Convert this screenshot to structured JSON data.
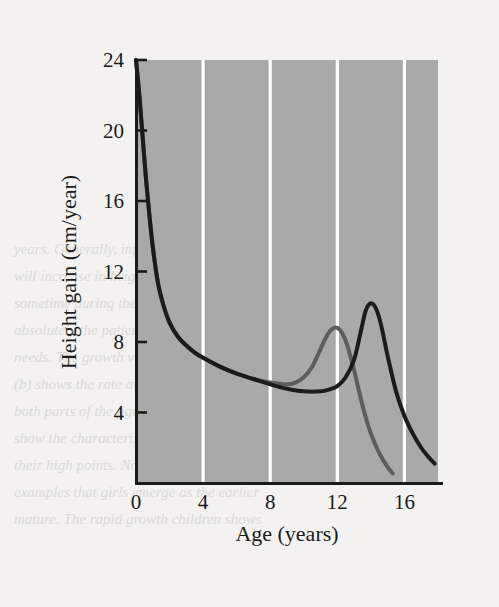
{
  "figure": {
    "plot_background_color": "#a9a9a7",
    "page_background_color": "#f3f2f0",
    "gridline_color": "#ffffff",
    "axis_color": "#1b1b1b"
  },
  "chart_data": {
    "type": "line",
    "title": "",
    "subtitle": "",
    "xlabel": "Age (years)",
    "ylabel": "Height gain (cm/year)",
    "xlim": [
      0,
      18
    ],
    "ylim": [
      0,
      24
    ],
    "xticks": [
      0,
      4,
      8,
      12,
      16
    ],
    "xtick_labels": [
      "0",
      "4",
      "8",
      "12",
      "16"
    ],
    "yticks": [
      4,
      8,
      12,
      16,
      20,
      24
    ],
    "ytick_labels": [
      "4",
      "8",
      "12",
      "16",
      "20",
      "24"
    ],
    "grid": "vertical-only",
    "grid_color": "#ffffff",
    "legend": "none",
    "legend_position": "none",
    "annotations": [],
    "series": [
      {
        "name": "girls",
        "color": "#5d5d5d",
        "line_width": 4,
        "peak_age": 12.0,
        "peak_value": 8.8,
        "x": [
          0,
          0.2,
          0.4,
          0.6,
          0.8,
          1.0,
          1.3,
          1.6,
          2.0,
          2.5,
          3.0,
          3.5,
          4.0,
          5.0,
          6.0,
          7.0,
          8.0,
          9.0,
          9.5,
          10.0,
          10.5,
          11.0,
          11.4,
          11.7,
          12.0,
          12.3,
          12.6,
          13.0,
          13.5,
          14.0,
          14.5,
          15.0,
          15.3
        ],
        "y": [
          24.0,
          22.0,
          19.6,
          17.2,
          15.2,
          13.4,
          11.4,
          10.2,
          9.1,
          8.3,
          7.8,
          7.4,
          7.1,
          6.6,
          6.2,
          5.9,
          5.7,
          5.6,
          5.7,
          6.0,
          6.6,
          7.6,
          8.4,
          8.75,
          8.8,
          8.5,
          7.8,
          6.4,
          4.4,
          2.8,
          1.7,
          0.9,
          0.55
        ]
      },
      {
        "name": "boys",
        "color": "#1b1b1b",
        "line_width": 4,
        "peak_age": 14.0,
        "peak_value": 10.2,
        "x": [
          0,
          0.2,
          0.4,
          0.6,
          0.8,
          1.0,
          1.3,
          1.6,
          2.0,
          2.5,
          3.0,
          3.5,
          4.0,
          5.0,
          6.0,
          7.0,
          8.0,
          9.0,
          10.0,
          11.0,
          11.5,
          12.0,
          12.5,
          13.0,
          13.4,
          13.7,
          14.0,
          14.3,
          14.6,
          15.0,
          15.5,
          16.0,
          16.5,
          17.0,
          17.5,
          17.8
        ],
        "y": [
          24.0,
          22.0,
          19.6,
          17.2,
          15.2,
          13.4,
          11.4,
          10.2,
          9.1,
          8.3,
          7.8,
          7.4,
          7.1,
          6.6,
          6.2,
          5.9,
          5.6,
          5.35,
          5.2,
          5.2,
          5.3,
          5.5,
          6.0,
          7.0,
          8.6,
          9.8,
          10.2,
          9.9,
          9.0,
          7.2,
          5.2,
          3.8,
          2.8,
          2.0,
          1.4,
          1.1
        ]
      }
    ]
  },
  "ghost_text": {
    "lines": [
      "years. Generally, infants and toddlers",
      "will increase in height by a third",
      "sometime during the second year, but",
      "absolutely the pattern is similar to their",
      "needs. The growth velocity curve in",
      "(b) shows the rate at which height is",
      "both parts of the figure, the curves",
      "show the characteristic growth spurt by",
      "their high points. Note also that the of",
      "examples that girls emerge as the earlier",
      "mature. The rapid growth children shows"
    ]
  }
}
